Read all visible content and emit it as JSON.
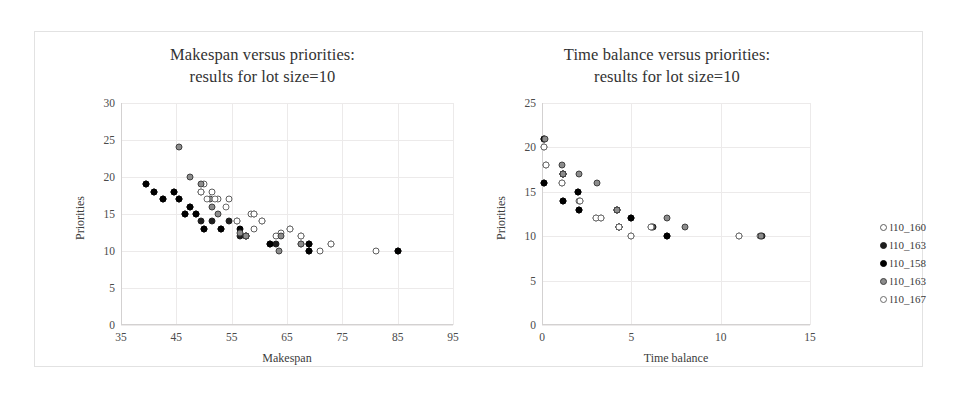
{
  "figure": {
    "background": "#ffffff",
    "frame_color": "#e2e2e2"
  },
  "legend": {
    "position": "right",
    "entries": [
      {
        "label": "l10_160",
        "style": "open",
        "color": "#ffffff"
      },
      {
        "label": "l10_163",
        "style": "dark",
        "color": "#1e1e1e"
      },
      {
        "label": "l10_158",
        "style": "black",
        "color": "#000000"
      },
      {
        "label": "l10_163",
        "style": "grey",
        "color": "#8c8c8c"
      },
      {
        "label": "l10_167",
        "style": "open2",
        "color": "#ffffff"
      }
    ]
  },
  "chart_data": [
    {
      "id": "makespan",
      "type": "scatter",
      "title_line1": "Makespan versus priorities:",
      "title_line2": "results for lot size=10",
      "xlabel": "Makespan",
      "ylabel": "Priorities",
      "xlim": [
        35,
        95
      ],
      "ylim": [
        0,
        30
      ],
      "xticks": [
        35,
        45,
        55,
        65,
        75,
        85,
        95
      ],
      "yticks": [
        0,
        5,
        10,
        15,
        20,
        25,
        30
      ],
      "grid": true,
      "series": [
        {
          "name": "l10_160",
          "style": "open",
          "points": [
            [
              50,
              19
            ],
            [
              51.5,
              18
            ],
            [
              52.5,
              17
            ],
            [
              54.5,
              17
            ],
            [
              56,
              14
            ],
            [
              58.5,
              15
            ],
            [
              59,
              13
            ],
            [
              60.5,
              14
            ],
            [
              63,
              12
            ],
            [
              64,
              12.5
            ],
            [
              65.5,
              13
            ],
            [
              67.5,
              12
            ],
            [
              67.5,
              11
            ],
            [
              71,
              10
            ],
            [
              73,
              11
            ],
            [
              81,
              10
            ]
          ]
        },
        {
          "name": "l10_163",
          "style": "dark",
          "points": [
            [
              39.5,
              19
            ],
            [
              41,
              18
            ],
            [
              42.5,
              17
            ],
            [
              44.5,
              18
            ],
            [
              45.5,
              17
            ],
            [
              46.5,
              15
            ],
            [
              47.5,
              16
            ],
            [
              48.5,
              15
            ],
            [
              49.5,
              14
            ],
            [
              50,
              13
            ],
            [
              51.5,
              14
            ],
            [
              53,
              13
            ],
            [
              54.5,
              14
            ],
            [
              56.5,
              12
            ],
            [
              57.5,
              12
            ],
            [
              62,
              11
            ],
            [
              63,
              11
            ],
            [
              69,
              11
            ],
            [
              69,
              10
            ],
            [
              85,
              10
            ]
          ]
        },
        {
          "name": "l10_158",
          "style": "black",
          "points": [
            [
              39.5,
              19
            ],
            [
              41,
              18
            ],
            [
              42.5,
              17
            ],
            [
              44.5,
              18
            ],
            [
              45.5,
              17
            ],
            [
              46.5,
              15
            ],
            [
              47.5,
              16
            ],
            [
              48.5,
              15
            ],
            [
              50,
              13
            ],
            [
              53,
              13
            ],
            [
              56.5,
              13
            ],
            [
              57.5,
              12
            ],
            [
              62,
              11
            ],
            [
              69,
              11
            ],
            [
              69,
              10
            ],
            [
              85,
              10
            ]
          ]
        },
        {
          "name": "l10_163b",
          "style": "grey",
          "points": [
            [
              45.5,
              24
            ],
            [
              47.5,
              20
            ],
            [
              49.5,
              19
            ],
            [
              49.5,
              18
            ],
            [
              51,
              17
            ],
            [
              51.5,
              16
            ],
            [
              52.5,
              15
            ],
            [
              56.5,
              12.5
            ],
            [
              57.5,
              12
            ],
            [
              59,
              15
            ],
            [
              63.5,
              10
            ],
            [
              64,
              12
            ],
            [
              67.5,
              11
            ]
          ]
        },
        {
          "name": "l10_167",
          "style": "open2",
          "points": [
            [
              49.5,
              18
            ],
            [
              50.5,
              17
            ],
            [
              52,
              17
            ],
            [
              54,
              16
            ],
            [
              56,
              14
            ],
            [
              59,
              15
            ],
            [
              60.5,
              14
            ],
            [
              65.5,
              13
            ],
            [
              67.5,
              12
            ],
            [
              73,
              11
            ]
          ]
        }
      ]
    },
    {
      "id": "timebalance",
      "type": "scatter",
      "title_line1": "Time balance versus priorities:",
      "title_line2": "results for lot size=10",
      "xlabel": "Time balance",
      "ylabel": "Priorities",
      "xlim": [
        0,
        15
      ],
      "ylim": [
        0,
        25
      ],
      "xticks": [
        0,
        5,
        10,
        15
      ],
      "yticks": [
        0,
        5,
        10,
        15,
        20,
        25
      ],
      "grid": true,
      "series": [
        {
          "name": "l10_160",
          "style": "open",
          "points": [
            [
              0.1,
              20
            ],
            [
              0.25,
              18
            ],
            [
              1.1,
              16
            ],
            [
              1.15,
              17
            ],
            [
              2.05,
              14
            ],
            [
              2.1,
              14
            ],
            [
              3.0,
              12
            ],
            [
              3.3,
              12
            ],
            [
              4.3,
              11
            ],
            [
              5.0,
              10
            ],
            [
              6.1,
              11
            ],
            [
              11.0,
              10
            ],
            [
              12.2,
              10
            ]
          ]
        },
        {
          "name": "l10_163",
          "style": "dark",
          "points": [
            [
              0.1,
              21
            ],
            [
              0.1,
              16
            ],
            [
              1.2,
              17
            ],
            [
              1.2,
              14
            ],
            [
              2.0,
              15
            ],
            [
              2.05,
              13
            ],
            [
              4.2,
              13
            ],
            [
              4.3,
              11
            ],
            [
              5.0,
              12
            ],
            [
              6.2,
              11
            ],
            [
              7.0,
              10
            ],
            [
              12.3,
              10
            ]
          ]
        },
        {
          "name": "l10_158",
          "style": "black",
          "points": [
            [
              0.1,
              21
            ],
            [
              0.1,
              16
            ],
            [
              1.2,
              17
            ],
            [
              1.2,
              14
            ],
            [
              2.0,
              15
            ],
            [
              2.05,
              13
            ],
            [
              4.2,
              13
            ],
            [
              4.3,
              11
            ],
            [
              5.0,
              12
            ],
            [
              7.0,
              10
            ]
          ]
        },
        {
          "name": "l10_163b",
          "style": "grey",
          "points": [
            [
              0.15,
              21
            ],
            [
              1.1,
              18
            ],
            [
              1.15,
              17
            ],
            [
              2.05,
              17
            ],
            [
              3.1,
              16
            ],
            [
              4.2,
              13
            ],
            [
              6.15,
              11
            ],
            [
              7.0,
              12
            ],
            [
              8.0,
              11
            ],
            [
              12.25,
              10
            ]
          ]
        },
        {
          "name": "l10_167",
          "style": "open2",
          "points": [
            [
              0.1,
              20
            ],
            [
              0.25,
              18
            ],
            [
              1.1,
              16
            ],
            [
              2.1,
              14
            ],
            [
              3.0,
              12
            ],
            [
              3.3,
              12
            ],
            [
              4.3,
              11
            ],
            [
              5.0,
              10
            ],
            [
              6.1,
              11
            ],
            [
              11.0,
              10
            ]
          ]
        }
      ]
    }
  ]
}
